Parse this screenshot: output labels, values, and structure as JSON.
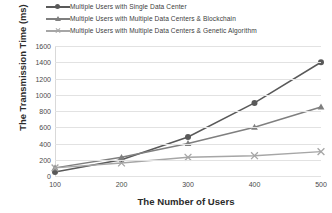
{
  "chart_data": {
    "type": "line",
    "title": "",
    "xlabel": "The Number of Users",
    "ylabel": "The Transmission Time (ms)",
    "categories": [
      100,
      200,
      300,
      400,
      500
    ],
    "x": [
      100,
      200,
      300,
      400,
      500
    ],
    "xlim": [
      100,
      500
    ],
    "ylim": [
      0,
      1600
    ],
    "yticks": [
      0,
      200,
      400,
      600,
      800,
      1000,
      1200,
      1400,
      1600
    ],
    "ytick_labels": [
      "0",
      "200",
      "400",
      "600",
      "800",
      "1000",
      "1200",
      "1400",
      "1600"
    ],
    "xtick_labels": [
      "100",
      "200",
      "300",
      "400",
      "500"
    ],
    "grid": "horizontal",
    "legend_position": "top",
    "series": [
      {
        "name": "Multiple Users with Single Data Center",
        "marker": "circle",
        "color": "#595959",
        "values": [
          50,
          200,
          480,
          900,
          1400
        ]
      },
      {
        "name": "Multiple Users with Multiple Data Centers & Blockchain",
        "marker": "triangle",
        "color": "#7f7f7f",
        "values": [
          100,
          230,
          400,
          600,
          850
        ]
      },
      {
        "name": "Multiple Users with Multiple Data Centers & Genetic Algorithm",
        "marker": "x",
        "color": "#a6a6a6",
        "values": [
          100,
          160,
          230,
          250,
          300
        ]
      }
    ]
  },
  "legend": {
    "items": [
      {
        "label": "Multiple Users with Single Data Center",
        "color": "#595959",
        "marker": "circle"
      },
      {
        "label": "Multiple Users with Multiple Data Centers & Blockchain",
        "color": "#7f7f7f",
        "marker": "triangle"
      },
      {
        "label": "Multiple Users with Multiple Data Centers & Genetic Algorithm",
        "color": "#a6a6a6",
        "marker": "x"
      }
    ]
  },
  "axes": {
    "x_title": "The Number of Users",
    "y_title": "The Transmission Time (ms)"
  }
}
